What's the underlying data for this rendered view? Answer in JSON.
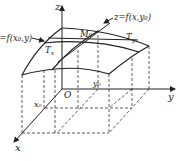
{
  "figure": {
    "axes": {
      "x_label": "x",
      "y_label": "y",
      "z_label": "z",
      "origin_label": "O"
    },
    "curves": {
      "left_curve_label": "z=f(x₀,y)",
      "right_curve_label": "z=f(x,y₀)"
    },
    "point": {
      "label": "M₀"
    },
    "tangents": {
      "tx_label": "T",
      "tx_sub": "x",
      "ty_label": "T",
      "ty_sub": "y"
    },
    "ticks": {
      "x0_label": "x₀",
      "y0_label": "y₀"
    },
    "colors": {
      "line": "#222222",
      "background": "#ffffff"
    }
  }
}
